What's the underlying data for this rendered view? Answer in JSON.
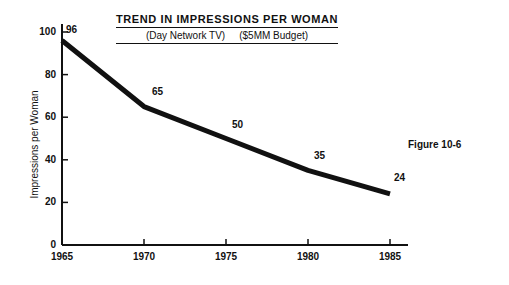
{
  "chart_data": {
    "type": "line",
    "title": "TREND IN IMPRESSIONS PER WOMAN",
    "subtitle_left": "(Day Network TV)",
    "subtitle_right": "($5MM Budget)",
    "xlabel": "",
    "ylabel": "Impressions per Woman",
    "x": [
      1965,
      1970,
      1975,
      1980,
      1985
    ],
    "values": [
      96,
      65,
      50,
      35,
      24
    ],
    "point_labels": [
      "96",
      "65",
      "50",
      "35",
      "24"
    ],
    "xtick_labels": [
      "1965",
      "1970",
      "1975",
      "1980",
      "1985"
    ],
    "ytick_labels": [
      "0",
      "20",
      "40",
      "60",
      "80",
      "100"
    ],
    "ytick_values": [
      0,
      20,
      40,
      60,
      80,
      100
    ],
    "xlim": [
      1965,
      1985
    ],
    "ylim": [
      0,
      100
    ],
    "grid": false,
    "legend": false,
    "line_color": "#111111",
    "background_color": "#ffffff"
  },
  "caption": {
    "figure_number": "Figure 10-6"
  }
}
